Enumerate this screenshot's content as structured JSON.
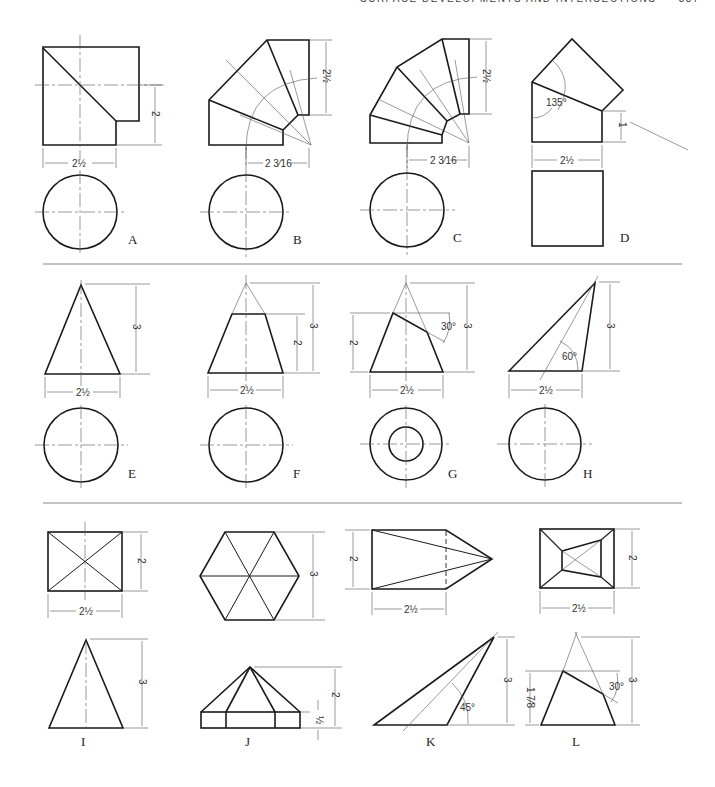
{
  "header": {
    "running_title": "SURFACE DEVELOPMENTS AND INTERSECTIONS",
    "page_number": "337"
  },
  "figures": [
    {
      "label": "A",
      "description": "Two-piece elbow, cylinder mitered",
      "dims": [
        "2",
        "2 1/2"
      ]
    },
    {
      "label": "B",
      "description": "Three-piece elbow",
      "dims": [
        "2 1/2",
        "2 3/16"
      ]
    },
    {
      "label": "C",
      "description": "Four-piece elbow",
      "dims": [
        "2 1/2",
        "2 3/16"
      ]
    },
    {
      "label": "D",
      "description": "Square prism elbow 135 degrees",
      "dims": [
        "135°",
        "1",
        "2 1/2"
      ]
    },
    {
      "label": "E",
      "description": "Right circular cone",
      "dims": [
        "3",
        "2 1/2"
      ]
    },
    {
      "label": "F",
      "description": "Frustum of cone",
      "dims": [
        "2",
        "3",
        "2 1/2"
      ]
    },
    {
      "label": "G",
      "description": "Truncated cone cut at 30 degrees",
      "dims": [
        "2",
        "30°",
        "3",
        "2 1/2"
      ]
    },
    {
      "label": "H",
      "description": "Oblique cone at 60 degrees",
      "dims": [
        "60°",
        "3",
        "2 1/2"
      ]
    },
    {
      "label": "I",
      "description": "Rectangular pyramid",
      "dims": [
        "2",
        "2 1/2",
        "3"
      ]
    },
    {
      "label": "J",
      "description": "Hexagonal pyramid on prism",
      "dims": [
        "3",
        "2",
        "1/2"
      ]
    },
    {
      "label": "K",
      "description": "Oblique pyramid at 45 degrees",
      "dims": [
        "2",
        "2 1/2",
        "45°",
        "3"
      ]
    },
    {
      "label": "L",
      "description": "Truncated pyramid cut at 30 degrees",
      "dims": [
        "2",
        "2 1/2",
        "1 7/8",
        "30°",
        "3"
      ]
    }
  ],
  "dims": {
    "two": "2",
    "three": "3",
    "one": "1",
    "two_half": "2½",
    "two_3_16": "2 3⁄16",
    "half": "½",
    "one_7_8": "1 7⁄8",
    "deg135": "135°",
    "deg30": "30°",
    "deg60": "60°",
    "deg45": "45°"
  }
}
